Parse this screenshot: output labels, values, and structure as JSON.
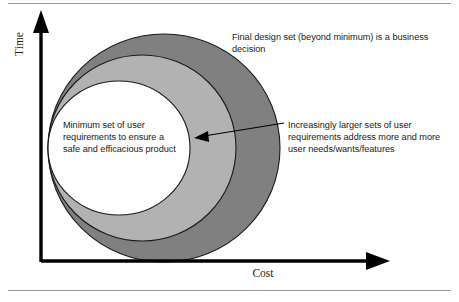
{
  "figure": {
    "title_implied": "Cost vs Time requirement set diagram",
    "axes": {
      "y_label": "Time",
      "x_label": "Cost",
      "axis_color": "#000000"
    },
    "rules": {
      "top_rule_color": "#9a9a9a",
      "bottom_rule_color": "#9a9a9a"
    },
    "ellipses": [
      {
        "name": "outer-ellipse",
        "fill": "#808080",
        "stroke": "#1a1a1a",
        "meaning": "Final design set (beyond minimum)"
      },
      {
        "name": "middle-ellipse",
        "fill": "#b2b2b2",
        "stroke": "#1a1a1a",
        "meaning": "Increasingly larger sets of user requirements"
      },
      {
        "name": "inner-ellipse",
        "fill": "#ffffff",
        "stroke": "#1a1a1a",
        "meaning": "Minimum set of user requirements"
      }
    ],
    "callouts": {
      "top": "Final design set (beyond minimum) is a business decision",
      "right": "Increasingly larger sets of user requirements address more and more user needs/wants/features",
      "inner": "Minimum set of user requirements to ensure a safe and efficacious product"
    },
    "arrow": {
      "name": "pointer-arrow",
      "color": "#000000",
      "from_x": 284,
      "from_y": 123,
      "to_x": 196,
      "to_y": 138
    }
  }
}
